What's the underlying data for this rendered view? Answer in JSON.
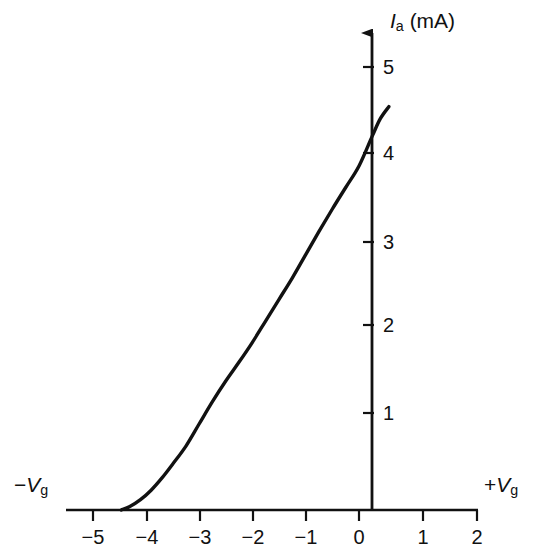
{
  "chart_data": {
    "type": "line",
    "title": "",
    "subtitle": "",
    "xlabel_negative": "−Vg",
    "xlabel_positive": "+Vg",
    "ylabel": "Ia (mA)",
    "ylabel_symbol": "I",
    "ylabel_subscript": "a",
    "ylabel_units": "(mA)",
    "xlabel_symbol": "V",
    "xlabel_subscript": "g",
    "x_sign_negative": "−",
    "x_sign_positive": "+",
    "xlim": [
      -5.6,
      2.2
    ],
    "ylim": [
      0,
      5.5
    ],
    "x_ticks": [
      -5,
      -4,
      -3,
      -2,
      -1,
      0,
      1,
      2
    ],
    "x_tick_labels": [
      "−5",
      "−4",
      "−3",
      "−2",
      "−1",
      "0",
      "1",
      "2"
    ],
    "y_ticks": [
      1,
      2,
      3,
      4,
      5
    ],
    "y_tick_labels": [
      "1",
      "2",
      "3",
      "4",
      "5"
    ],
    "grid": false,
    "legend": false,
    "curve_color": "#111111",
    "axis_color": "#111111",
    "series": [
      {
        "name": "anode-characteristic",
        "points": [
          [
            -4.46,
            0.0
          ],
          [
            -4.3,
            0.04
          ],
          [
            -4.1,
            0.12
          ],
          [
            -3.9,
            0.23
          ],
          [
            -3.7,
            0.37
          ],
          [
            -3.5,
            0.53
          ],
          [
            -3.25,
            0.74
          ],
          [
            -3.0,
            1.0
          ],
          [
            -2.75,
            1.26
          ],
          [
            -2.5,
            1.5
          ],
          [
            -2.25,
            1.72
          ],
          [
            -2.0,
            1.95
          ],
          [
            -1.75,
            2.2
          ],
          [
            -1.5,
            2.45
          ],
          [
            -1.25,
            2.7
          ],
          [
            -1.0,
            2.97
          ],
          [
            -0.75,
            3.24
          ],
          [
            -0.5,
            3.5
          ],
          [
            -0.25,
            3.75
          ],
          [
            0.0,
            4.0
          ],
          [
            0.25,
            4.35
          ],
          [
            0.4,
            4.55
          ],
          [
            0.56,
            4.69
          ]
        ]
      }
    ],
    "annotations": [
      {
        "name": "zero-current-baseline",
        "text": "",
        "from_x": -5.4,
        "to_x": -4.46,
        "y": 0
      }
    ]
  },
  "axes": {
    "y_axis_arrow": "up-arrow",
    "x_axis_arrow": "none"
  }
}
